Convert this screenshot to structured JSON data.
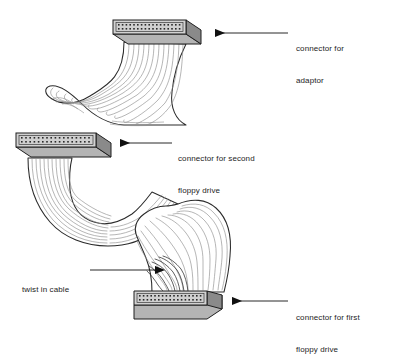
{
  "diagram": {
    "background_color": "#ffffff",
    "line_color": "#1a1a1a",
    "cable_fill": "#ffffff",
    "cable_stripe_color": "#8e8e8e",
    "connector_top_color": "#d2d2d2",
    "connector_front_color": "#b4b4b4",
    "connector_end_color": "#8a8a8a",
    "pin_color": "#2a2a2a",
    "arrow_color": "#111111"
  },
  "labels": {
    "adaptor": {
      "line1": "connector for",
      "line2": "adaptor"
    },
    "second_floppy": {
      "line1": "connector for second",
      "line2": "floppy drive"
    },
    "first_floppy": {
      "line1": "connector for first",
      "line2": "floppy drive"
    },
    "twist": {
      "line1": "twist in cable",
      "line2": ""
    }
  },
  "connectors": [
    {
      "id": "adaptor-connector",
      "name": "connector for adaptor",
      "pin_rows": 2,
      "pins_per_row": 17,
      "position": "top"
    },
    {
      "id": "second-floppy-connector",
      "name": "connector for second floppy drive",
      "pin_rows": 2,
      "pins_per_row": 17,
      "position": "middle-left"
    },
    {
      "id": "first-floppy-connector",
      "name": "connector for first floppy drive",
      "pin_rows": 2,
      "pins_per_row": 17,
      "position": "bottom"
    }
  ],
  "arrows": [
    {
      "id": "arrow-adaptor",
      "direction": "left",
      "target": "adaptor-connector"
    },
    {
      "id": "arrow-second-floppy",
      "direction": "left",
      "target": "second-floppy-connector"
    },
    {
      "id": "arrow-first-floppy",
      "direction": "left",
      "target": "first-floppy-connector"
    },
    {
      "id": "arrow-twist",
      "direction": "right",
      "target": "cable-twist"
    }
  ]
}
